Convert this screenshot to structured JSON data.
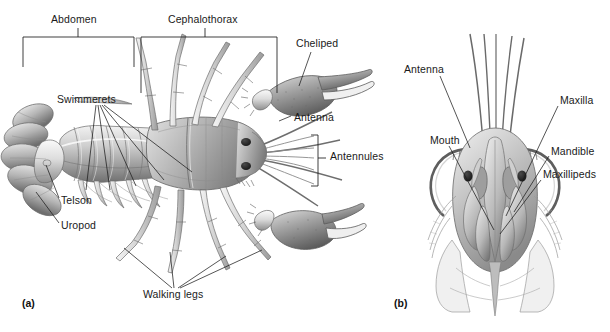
{
  "figure": {
    "background_color": "#ffffff",
    "line_color": "#1c1c1c",
    "text_color": "#1a1a1a",
    "width": 610,
    "height": 332
  },
  "panels": [
    {
      "id": "a",
      "caption": "(a)",
      "view": "dorsal-lateral whole body",
      "caption_x": 22,
      "caption_y": 303
    },
    {
      "id": "b",
      "caption": "(b)",
      "view": "ventral head with mouthparts",
      "caption_x": 394,
      "caption_y": 303
    }
  ],
  "brackets": [
    {
      "name": "abdomen-bracket",
      "label": "Abdomen",
      "x1": 23,
      "x2": 134,
      "y": 37,
      "tick": 30,
      "label_x": 51,
      "label_y": 21
    },
    {
      "name": "cephalothorax-bracket",
      "label": "Cephalothorax",
      "x1": 141,
      "x2": 277,
      "y": 37,
      "tick": 56,
      "label_x": 168,
      "label_y": 21
    },
    {
      "name": "antennules-bracket",
      "label": "Antennules",
      "x": 318,
      "y1": 135,
      "y2": 186,
      "label_x": 330,
      "label_y": 156
    }
  ],
  "labels_panel_a": [
    {
      "name": "label-abdomen",
      "text": "Abdomen",
      "x": 51,
      "y": 21
    },
    {
      "name": "label-cephalothorax",
      "text": "Cephalothorax",
      "x": 168,
      "y": 21
    },
    {
      "name": "label-cheliped",
      "text": "Cheliped",
      "x": 296,
      "y": 44
    },
    {
      "name": "label-swimmerets",
      "text": "Swimmerets",
      "x": 57,
      "y": 100
    },
    {
      "name": "label-antenna-a",
      "text": "Antenna",
      "x": 294,
      "y": 118
    },
    {
      "name": "label-antennules",
      "text": "Antennules",
      "x": 330,
      "y": 156
    },
    {
      "name": "label-telson",
      "text": "Telson",
      "x": 61,
      "y": 201
    },
    {
      "name": "label-uropod",
      "text": "Uropod",
      "x": 61,
      "y": 226
    },
    {
      "name": "label-walking-legs",
      "text": "Walking legs",
      "x": 143,
      "y": 294
    }
  ],
  "labels_panel_b": [
    {
      "name": "label-antenna-b",
      "text": "Antenna",
      "x": 404,
      "y": 70
    },
    {
      "name": "label-mouth",
      "text": "Mouth",
      "x": 430,
      "y": 141
    },
    {
      "name": "label-maxilla",
      "text": "Maxilla",
      "x": 560,
      "y": 101
    },
    {
      "name": "label-mandible",
      "text": "Mandible",
      "x": 551,
      "y": 152
    },
    {
      "name": "label-maxillipeds",
      "text": "Maxillipeds",
      "x": 543,
      "y": 175
    }
  ],
  "colors": {
    "shell_light": "#e9e9e9",
    "shell_mid": "#bdbdbd",
    "shell_dark": "#8c8c8c",
    "shell_shadow": "#5f5f5f",
    "outline": "#555555"
  }
}
